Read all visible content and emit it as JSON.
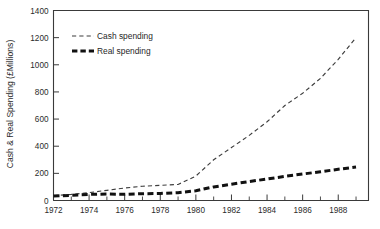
{
  "chart_data": {
    "type": "line",
    "title": "",
    "xlabel": "",
    "ylabel": "Cash & Real Spending (£Millions)",
    "xlim": [
      1972,
      1989.7
    ],
    "ylim": [
      0,
      1400
    ],
    "grid": false,
    "legend_position": "top-left",
    "x_ticks": [
      "1972",
      "1974",
      "1976",
      "1978",
      "1980",
      "1982",
      "1984",
      "1986",
      "1988"
    ],
    "x_tick_values": [
      1972,
      1974,
      1976,
      1978,
      1980,
      1982,
      1984,
      1986,
      1988
    ],
    "x_minor_tick_values": [
      1973,
      1975,
      1977,
      1979,
      1981,
      1983,
      1985,
      1987,
      1989
    ],
    "y_ticks": [
      "0",
      "200",
      "400",
      "600",
      "800",
      "1000",
      "1200",
      "1400"
    ],
    "y_tick_values": [
      0,
      200,
      400,
      600,
      800,
      1000,
      1200,
      1400
    ],
    "x": [
      1972,
      1973,
      1974,
      1975,
      1976,
      1977,
      1978,
      1979,
      1980,
      1981,
      1982,
      1983,
      1984,
      1985,
      1986,
      1987,
      1988,
      1989
    ],
    "series": [
      {
        "name": "Cash spending",
        "style": "dashed-thin",
        "color": "#3d3d3d",
        "values": [
          35,
          45,
          58,
          75,
          92,
          105,
          112,
          118,
          180,
          300,
          390,
          480,
          580,
          700,
          790,
          900,
          1040,
          1200
        ]
      },
      {
        "name": "Real spending",
        "style": "dashed-thick",
        "color": "#111111",
        "values": [
          33,
          38,
          45,
          48,
          46,
          50,
          52,
          58,
          72,
          100,
          120,
          140,
          158,
          178,
          195,
          212,
          230,
          247
        ]
      }
    ],
    "legend": [
      {
        "label": "Cash spending",
        "style": "dashed-thin"
      },
      {
        "label": "Real spending",
        "style": "dashed-thick"
      }
    ]
  },
  "colors": {
    "axis": "#3a3a3a",
    "text": "#2b2b2b",
    "background": "#ffffff",
    "series_cash": "#3d3d3d",
    "series_real": "#111111"
  }
}
